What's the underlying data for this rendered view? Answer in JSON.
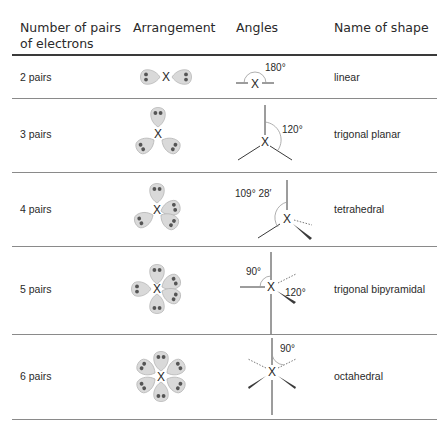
{
  "table": {
    "headers": {
      "pairs_line1": "Number of pairs",
      "pairs_line2": "of electrons",
      "arrangement": "Arrangement",
      "angles": "Angles",
      "shape": "Name of shape"
    },
    "rows": [
      {
        "pairs": "2 pairs",
        "angle": "180°",
        "shape": "linear"
      },
      {
        "pairs": "3 pairs",
        "angle": "120°",
        "shape": "trigonal planar"
      },
      {
        "pairs": "4 pairs",
        "angle": "109° 28′",
        "shape": "tetrahedral"
      },
      {
        "pairs": "5 pairs",
        "angle_a": "90°",
        "angle_b": "120°",
        "shape": "trigonal bipyramidal"
      },
      {
        "pairs": "6 pairs",
        "angle": "90°",
        "shape": "octahedral"
      }
    ],
    "central_atom": "X"
  },
  "colors": {
    "lobe_fill": "#d9d9d9",
    "lobe_stroke": "#b5b5b5",
    "electron_dot": "#555555",
    "line": "#3a3a3a"
  }
}
